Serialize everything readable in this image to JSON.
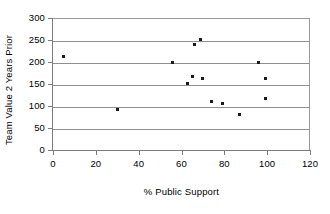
{
  "chart_data": {
    "type": "scatter",
    "title": "",
    "xlabel": "% Public Support",
    "ylabel": "Team Value 2 Years Prior",
    "xlim": [
      0,
      120
    ],
    "ylim": [
      0,
      300
    ],
    "xticks": [
      0,
      20,
      40,
      60,
      80,
      100,
      120
    ],
    "yticks": [
      0,
      50,
      100,
      150,
      200,
      250,
      300
    ],
    "xtick_labels": [
      "0",
      "20",
      "40",
      "60",
      "80",
      "100",
      "120"
    ],
    "ytick_labels": [
      "0",
      "50",
      "100",
      "150",
      "200",
      "250",
      "300"
    ],
    "grid": "horizontal",
    "legend": "none",
    "marker_color": "#1a1a1a",
    "gridline_color": "#8f8f8f",
    "axis_color": "#7d7d7d",
    "series": [
      {
        "name": "teams",
        "points": [
          {
            "x": 5,
            "y": 213
          },
          {
            "x": 30,
            "y": 93
          },
          {
            "x": 56,
            "y": 198
          },
          {
            "x": 63,
            "y": 152
          },
          {
            "x": 65,
            "y": 168
          },
          {
            "x": 66,
            "y": 240
          },
          {
            "x": 69,
            "y": 251
          },
          {
            "x": 70,
            "y": 162
          },
          {
            "x": 74,
            "y": 110
          },
          {
            "x": 79,
            "y": 106
          },
          {
            "x": 87,
            "y": 81
          },
          {
            "x": 96,
            "y": 200
          },
          {
            "x": 99,
            "y": 163
          },
          {
            "x": 99,
            "y": 116
          }
        ]
      }
    ]
  }
}
